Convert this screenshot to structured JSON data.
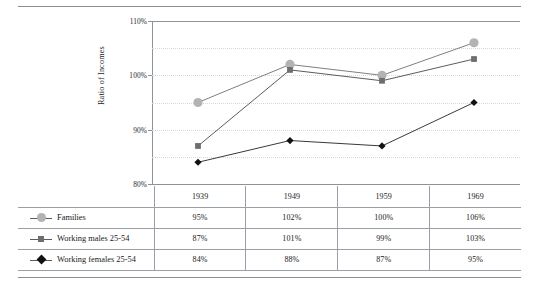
{
  "chart_data": {
    "type": "line",
    "title": "",
    "xlabel": "",
    "ylabel": "Ratio of Incomes",
    "categories": [
      "1939",
      "1949",
      "1959",
      "1969"
    ],
    "ylim": [
      80,
      110
    ],
    "ytick_labels": [
      "110%",
      "100%",
      "90%",
      "80%"
    ],
    "ytick_values": [
      110,
      100,
      90,
      80
    ],
    "gridlines": [
      105,
      100,
      95,
      90,
      85
    ],
    "grid": true,
    "legend_position": "table-left",
    "series": [
      {
        "name": "Families",
        "marker": "circle",
        "color": "#b3b3b3",
        "line_color": "#7f7f7f",
        "values": [
          95,
          102,
          100,
          106
        ],
        "labels": [
          "95%",
          "102%",
          "100%",
          "106%"
        ]
      },
      {
        "name": "Working males 25-54",
        "marker": "square",
        "color": "#6e6e6e",
        "line_color": "#5c5c5c",
        "values": [
          87,
          101,
          99,
          103
        ],
        "labels": [
          "87%",
          "101%",
          "99%",
          "103%"
        ]
      },
      {
        "name": "Working females 25-54",
        "marker": "diamond",
        "color": "#111111",
        "line_color": "#3a3a3a",
        "values": [
          84,
          88,
          87,
          95
        ],
        "labels": [
          "84%",
          "88%",
          "87%",
          "95%"
        ]
      }
    ]
  },
  "table": {
    "corner_label": "",
    "column_headers": [
      "1939",
      "1949",
      "1959",
      "1969"
    ],
    "rows": [
      {
        "label": "Families",
        "marker": "circle",
        "values": [
          "95%",
          "102%",
          "100%",
          "106%"
        ]
      },
      {
        "label": "Working males 25-54",
        "marker": "square",
        "values": [
          "87%",
          "101%",
          "99%",
          "103%"
        ]
      },
      {
        "label": "Working females 25-54",
        "marker": "diamond",
        "values": [
          "84%",
          "88%",
          "87%",
          "95%"
        ]
      }
    ]
  },
  "axis": {
    "y_title": "Ratio of Incomes",
    "y_labels": [
      "110%",
      "100%",
      "90%",
      "80%"
    ]
  },
  "colors": {
    "rule": "#8a8f94",
    "grid": "#d9d9d9",
    "axis": "#8e9399",
    "families": "#b3b3b3",
    "males": "#6e6e6e",
    "females": "#111111"
  }
}
